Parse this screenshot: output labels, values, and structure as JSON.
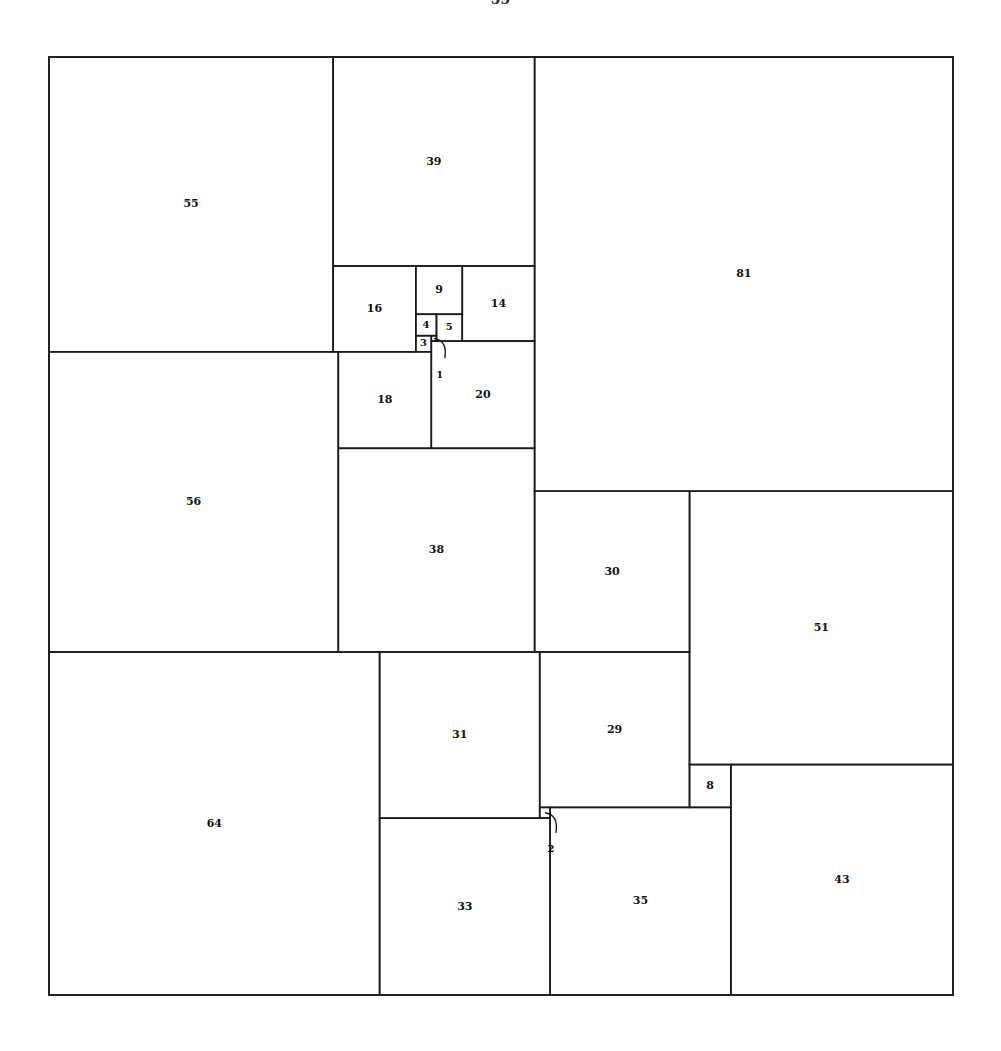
{
  "page": {
    "header_number": "55"
  },
  "diagram": {
    "outer_size": 175,
    "squares": [
      {
        "label": "55",
        "size": 55,
        "x": 0,
        "y": 0
      },
      {
        "label": "39",
        "size": 39,
        "x": 55,
        "y": 0
      },
      {
        "label": "81",
        "size": 81,
        "x": 94,
        "y": 0
      },
      {
        "label": "16",
        "size": 16,
        "x": 55,
        "y": 39
      },
      {
        "label": "9",
        "size": 9,
        "x": 71,
        "y": 39
      },
      {
        "label": "14",
        "size": 14,
        "x": 80,
        "y": 39
      },
      {
        "label": "4",
        "size": 4,
        "x": 71,
        "y": 48
      },
      {
        "label": "5",
        "size": 5,
        "x": 75,
        "y": 48
      },
      {
        "label": "3",
        "size": 3,
        "x": 71,
        "y": 52
      },
      {
        "label": "1",
        "size": 1,
        "x": 74,
        "y": 52,
        "callout": true
      },
      {
        "label": "20",
        "size": 20,
        "x": 74,
        "y": 53
      },
      {
        "label": "18",
        "size": 18,
        "x": 56,
        "y": 55
      },
      {
        "label": "56",
        "size": 56,
        "x": 0,
        "y": 55
      },
      {
        "label": "38",
        "size": 38,
        "x": 56,
        "y": 73
      },
      {
        "label": "30",
        "size": 30,
        "x": 94,
        "y": 81
      },
      {
        "label": "51",
        "size": 51,
        "x": 124,
        "y": 81
      },
      {
        "label": "64",
        "size": 64,
        "x": 0,
        "y": 111
      },
      {
        "label": "31",
        "size": 31,
        "x": 64,
        "y": 111
      },
      {
        "label": "29",
        "size": 29,
        "x": 95,
        "y": 111
      },
      {
        "label": "8",
        "size": 8,
        "x": 124,
        "y": 132
      },
      {
        "label": "43",
        "size": 43,
        "x": 132,
        "y": 132
      },
      {
        "label": "33",
        "size": 33,
        "x": 64,
        "y": 142
      },
      {
        "label": "35",
        "size": 35,
        "x": 97,
        "y": 140
      },
      {
        "label": "2",
        "size": 2,
        "x": 95,
        "y": 140,
        "callout": true
      }
    ]
  }
}
